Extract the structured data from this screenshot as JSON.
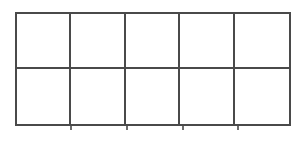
{
  "figure": {
    "name": "ten-frame",
    "title": "",
    "background_color": "#ffffff",
    "line_color": "#4a4a4a",
    "tick_color": "#6d6d6d",
    "line_width_px": 2,
    "columns": 5,
    "rows": 2,
    "total_cells": 10,
    "filled_cells": 0,
    "empty_cells": 10,
    "bounds": {
      "left_px": 15,
      "top_px": 12,
      "right_px": 291,
      "bottom_px": 126,
      "width_px": 276,
      "height_px": 114
    },
    "cell_size": {
      "width_px": 55,
      "height_px": 57
    },
    "vertical_rules_x_px": [
      15,
      70,
      126,
      182,
      237,
      291
    ],
    "horizontal_rules_y_px": [
      12,
      69,
      126
    ],
    "cells": [
      {
        "row": 1,
        "col": 1,
        "label": "",
        "filled": false
      },
      {
        "row": 1,
        "col": 2,
        "label": "",
        "filled": false
      },
      {
        "row": 1,
        "col": 3,
        "label": "",
        "filled": false
      },
      {
        "row": 1,
        "col": 4,
        "label": "",
        "filled": false
      },
      {
        "row": 1,
        "col": 5,
        "label": "",
        "filled": false
      },
      {
        "row": 2,
        "col": 1,
        "label": "",
        "filled": false
      },
      {
        "row": 2,
        "col": 2,
        "label": "",
        "filled": false
      },
      {
        "row": 2,
        "col": 3,
        "label": "",
        "filled": false
      },
      {
        "row": 2,
        "col": 4,
        "label": "",
        "filled": false
      },
      {
        "row": 2,
        "col": 5,
        "label": "",
        "filled": false
      }
    ],
    "overshoot_ticks_x_px": [
      70,
      126,
      182,
      237
    ]
  }
}
